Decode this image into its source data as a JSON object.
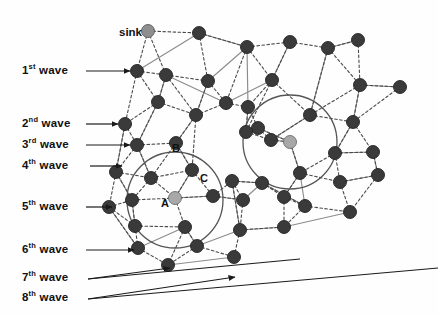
{
  "figure": {
    "type": "network-wave-diagram",
    "background_color": "#fefefe",
    "width": 438,
    "height": 315
  },
  "colors": {
    "node_dark": "#3a3a3a",
    "node_light": "#a8a8a8",
    "node_sink": "#8f8f8f",
    "edge_solid": "#8c8c8c",
    "edge_dashed": "#4a4a4a",
    "circle_stroke": "#555555",
    "arrow": "#1a1a1a",
    "text": "#111111"
  },
  "waves": [
    {
      "id": "wave-1",
      "ordinal": "1",
      "suffix": "st",
      "word": "wave",
      "label_x": 22,
      "label_y": 64,
      "arrow_x1": 86,
      "arrow_y1": 71,
      "arrow_x2": 130,
      "arrow_y2": 71
    },
    {
      "id": "wave-2",
      "ordinal": "2",
      "suffix": "nd",
      "word": "wave",
      "label_x": 22,
      "label_y": 117,
      "arrow_x1": 86,
      "arrow_y1": 124,
      "arrow_x2": 118,
      "arrow_y2": 124
    },
    {
      "id": "wave-3",
      "ordinal": "3",
      "suffix": "rd",
      "word": "wave",
      "label_x": 22,
      "label_y": 138,
      "arrow_x1": 86,
      "arrow_y1": 145,
      "arrow_x2": 130,
      "arrow_y2": 145
    },
    {
      "id": "wave-4",
      "ordinal": "4",
      "suffix": "th",
      "word": "wave",
      "label_x": 22,
      "label_y": 159,
      "arrow_x1": 90,
      "arrow_y1": 166,
      "arrow_x2": 122,
      "arrow_y2": 166
    },
    {
      "id": "wave-5",
      "ordinal": "5",
      "suffix": "th",
      "word": "wave",
      "label_x": 22,
      "label_y": 200,
      "arrow_x1": 86,
      "arrow_y1": 207,
      "arrow_x2": 112,
      "arrow_y2": 207
    },
    {
      "id": "wave-6",
      "ordinal": "6",
      "suffix": "th",
      "word": "wave",
      "label_x": 22,
      "label_y": 243,
      "arrow_x1": 86,
      "arrow_y1": 250,
      "arrow_x2": 134,
      "arrow_y2": 250
    },
    {
      "id": "wave-7",
      "ordinal": "7",
      "suffix": "th",
      "word": "wave",
      "label_x": 22,
      "label_y": 271,
      "arrow_x1": 88,
      "arrow_y1": 279,
      "arrow_x2": 170,
      "arrow_y2": 268
    },
    {
      "id": "wave-8",
      "ordinal": "8",
      "suffix": "th",
      "word": "wave",
      "label_x": 22,
      "label_y": 291,
      "arrow_x1": 88,
      "arrow_y1": 299,
      "arrow_x2": 235,
      "arrow_y2": 277
    }
  ],
  "annotations": [
    {
      "id": "sink-label",
      "text": "sink",
      "x": 119,
      "y": 26
    },
    {
      "id": "node-a-label",
      "text": "A",
      "x": 161,
      "y": 197
    },
    {
      "id": "node-b-label",
      "text": "B",
      "x": 172,
      "y": 142
    },
    {
      "id": "node-c-label",
      "text": "C",
      "x": 200,
      "y": 172
    }
  ],
  "circles": [
    {
      "id": "coverage-circle-left",
      "cx": 175,
      "cy": 200,
      "r": 48
    },
    {
      "id": "coverage-circle-right",
      "cx": 290,
      "cy": 142,
      "r": 47
    }
  ],
  "nodes": [
    {
      "id": "n-sink",
      "x": 148,
      "y": 31,
      "r": 6.5,
      "kind": "sink"
    },
    {
      "id": "n-01",
      "x": 199,
      "y": 33,
      "r": 6.5,
      "kind": "dark"
    },
    {
      "id": "n-02",
      "x": 247,
      "y": 47,
      "r": 6.5,
      "kind": "dark"
    },
    {
      "id": "n-03",
      "x": 290,
      "y": 42,
      "r": 6.5,
      "kind": "dark"
    },
    {
      "id": "n-04",
      "x": 328,
      "y": 48,
      "r": 6.5,
      "kind": "dark"
    },
    {
      "id": "n-05",
      "x": 358,
      "y": 40,
      "r": 6.5,
      "kind": "dark"
    },
    {
      "id": "n-06",
      "x": 137,
      "y": 71,
      "r": 6.5,
      "kind": "dark"
    },
    {
      "id": "n-07",
      "x": 166,
      "y": 75,
      "r": 6.5,
      "kind": "dark"
    },
    {
      "id": "n-08",
      "x": 208,
      "y": 81,
      "r": 6.5,
      "kind": "dark"
    },
    {
      "id": "n-09",
      "x": 272,
      "y": 80,
      "r": 6.5,
      "kind": "dark"
    },
    {
      "id": "n-10",
      "x": 360,
      "y": 85,
      "r": 6.5,
      "kind": "dark"
    },
    {
      "id": "n-11",
      "x": 400,
      "y": 87,
      "r": 6.5,
      "kind": "dark"
    },
    {
      "id": "n-12",
      "x": 158,
      "y": 102,
      "r": 6.5,
      "kind": "dark"
    },
    {
      "id": "n-13",
      "x": 226,
      "y": 103,
      "r": 6.5,
      "kind": "dark"
    },
    {
      "id": "n-14",
      "x": 248,
      "y": 107,
      "r": 6.5,
      "kind": "dark"
    },
    {
      "id": "n-15",
      "x": 125,
      "y": 124,
      "r": 6.5,
      "kind": "dark"
    },
    {
      "id": "n-16",
      "x": 196,
      "y": 115,
      "r": 6.5,
      "kind": "dark"
    },
    {
      "id": "n-17",
      "x": 258,
      "y": 128,
      "r": 6.5,
      "kind": "dark"
    },
    {
      "id": "n-18",
      "x": 310,
      "y": 115,
      "r": 6.5,
      "kind": "dark"
    },
    {
      "id": "n-19",
      "x": 353,
      "y": 122,
      "r": 6.5,
      "kind": "dark"
    },
    {
      "id": "n-20",
      "x": 137,
      "y": 145,
      "r": 6.5,
      "kind": "dark"
    },
    {
      "id": "n-21",
      "x": 176,
      "y": 143,
      "r": 6.5,
      "kind": "dark"
    },
    {
      "id": "n-22",
      "x": 246,
      "y": 132,
      "r": 6.5,
      "kind": "dark"
    },
    {
      "id": "n-23",
      "x": 271,
      "y": 140,
      "r": 6.5,
      "kind": "dark"
    },
    {
      "id": "n-24",
      "x": 290,
      "y": 142,
      "r": 6.5,
      "kind": "light"
    },
    {
      "id": "n-25",
      "x": 335,
      "y": 153,
      "r": 6.5,
      "kind": "dark"
    },
    {
      "id": "n-26",
      "x": 373,
      "y": 152,
      "r": 6.5,
      "kind": "dark"
    },
    {
      "id": "n-27",
      "x": 116,
      "y": 172,
      "r": 6.5,
      "kind": "dark"
    },
    {
      "id": "n-28",
      "x": 151,
      "y": 178,
      "r": 6.5,
      "kind": "dark"
    },
    {
      "id": "n-29",
      "x": 192,
      "y": 170,
      "r": 6.5,
      "kind": "dark"
    },
    {
      "id": "n-30",
      "x": 232,
      "y": 181,
      "r": 6.5,
      "kind": "dark"
    },
    {
      "id": "n-31",
      "x": 262,
      "y": 183,
      "r": 6.5,
      "kind": "dark"
    },
    {
      "id": "n-32",
      "x": 300,
      "y": 173,
      "r": 6.5,
      "kind": "dark"
    },
    {
      "id": "n-33",
      "x": 340,
      "y": 182,
      "r": 6.5,
      "kind": "dark"
    },
    {
      "id": "n-34",
      "x": 378,
      "y": 175,
      "r": 6.5,
      "kind": "dark"
    },
    {
      "id": "n-a",
      "x": 175,
      "y": 198,
      "r": 6.5,
      "kind": "light"
    },
    {
      "id": "n-35",
      "x": 109,
      "y": 207,
      "r": 6.5,
      "kind": "dark"
    },
    {
      "id": "n-36",
      "x": 132,
      "y": 200,
      "r": 6.5,
      "kind": "dark"
    },
    {
      "id": "n-37",
      "x": 213,
      "y": 196,
      "r": 6.5,
      "kind": "dark"
    },
    {
      "id": "n-38",
      "x": 243,
      "y": 200,
      "r": 6.5,
      "kind": "dark"
    },
    {
      "id": "n-39",
      "x": 284,
      "y": 197,
      "r": 6.5,
      "kind": "dark"
    },
    {
      "id": "n-40",
      "x": 305,
      "y": 206,
      "r": 6.5,
      "kind": "dark"
    },
    {
      "id": "n-41",
      "x": 350,
      "y": 212,
      "r": 6.5,
      "kind": "dark"
    },
    {
      "id": "n-42",
      "x": 135,
      "y": 226,
      "r": 6.5,
      "kind": "dark"
    },
    {
      "id": "n-43",
      "x": 185,
      "y": 227,
      "r": 6.5,
      "kind": "dark"
    },
    {
      "id": "n-44",
      "x": 240,
      "y": 230,
      "r": 6.5,
      "kind": "dark"
    },
    {
      "id": "n-45",
      "x": 284,
      "y": 227,
      "r": 6.5,
      "kind": "dark"
    },
    {
      "id": "n-46",
      "x": 138,
      "y": 248,
      "r": 6.5,
      "kind": "dark"
    },
    {
      "id": "n-47",
      "x": 197,
      "y": 246,
      "r": 6.5,
      "kind": "dark"
    },
    {
      "id": "n-48",
      "x": 168,
      "y": 265,
      "r": 6.5,
      "kind": "dark"
    },
    {
      "id": "n-49",
      "x": 234,
      "y": 257,
      "r": 6.5,
      "kind": "dark"
    }
  ],
  "solid_edges": [
    [
      "n-06",
      "n-01"
    ],
    [
      "n-01",
      "n-02"
    ],
    [
      "n-07",
      "n-13"
    ],
    [
      "n-13",
      "n-09"
    ],
    [
      "n-09",
      "n-03"
    ],
    [
      "n-02",
      "n-14"
    ],
    [
      "n-14",
      "n-22"
    ],
    [
      "n-22",
      "n-17"
    ],
    [
      "n-17",
      "n-24"
    ],
    [
      "n-24",
      "n-23"
    ],
    [
      "n-23",
      "n-18"
    ],
    [
      "n-18",
      "n-04"
    ],
    [
      "n-04",
      "n-05"
    ],
    [
      "n-10",
      "n-11"
    ],
    [
      "n-19",
      "n-10"
    ],
    [
      "n-25",
      "n-19"
    ],
    [
      "n-26",
      "n-25"
    ],
    [
      "n-34",
      "n-26"
    ],
    [
      "n-33",
      "n-34"
    ],
    [
      "n-12",
      "n-20"
    ],
    [
      "n-20",
      "n-28"
    ],
    [
      "n-15",
      "n-27"
    ],
    [
      "n-16",
      "n-21"
    ],
    [
      "n-21",
      "n-29"
    ],
    [
      "n-29",
      "n-a"
    ],
    [
      "n-a",
      "n-37"
    ],
    [
      "n-37",
      "n-38"
    ],
    [
      "n-38",
      "n-31"
    ],
    [
      "n-31",
      "n-40"
    ],
    [
      "n-40",
      "n-32"
    ],
    [
      "n-32",
      "n-39"
    ],
    [
      "n-27",
      "n-36"
    ],
    [
      "n-36",
      "n-42"
    ],
    [
      "n-35",
      "n-46"
    ],
    [
      "n-46",
      "n-43"
    ],
    [
      "n-43",
      "n-47"
    ],
    [
      "n-47",
      "n-44"
    ],
    [
      "n-44",
      "n-45"
    ],
    [
      "n-45",
      "n-41"
    ],
    [
      "n-48",
      "n-49"
    ],
    [
      "n-24",
      "n-32"
    ],
    [
      "n-16",
      "n-08"
    ],
    [
      "n-08",
      "n-02"
    ],
    [
      "n-12",
      "n-07"
    ],
    [
      "n-30",
      "n-44"
    ],
    [
      "n-31",
      "n-30"
    ]
  ],
  "dashed_edges": [
    [
      "n-sink",
      "n-01"
    ],
    [
      "n-sink",
      "n-06"
    ],
    [
      "n-sink",
      "n-07"
    ],
    [
      "n-01",
      "n-08"
    ],
    [
      "n-01",
      "n-02"
    ],
    [
      "n-02",
      "n-03"
    ],
    [
      "n-02",
      "n-09"
    ],
    [
      "n-02",
      "n-13"
    ],
    [
      "n-03",
      "n-04"
    ],
    [
      "n-03",
      "n-09"
    ],
    [
      "n-04",
      "n-05"
    ],
    [
      "n-04",
      "n-10"
    ],
    [
      "n-04",
      "n-18"
    ],
    [
      "n-05",
      "n-10"
    ],
    [
      "n-06",
      "n-07"
    ],
    [
      "n-06",
      "n-12"
    ],
    [
      "n-06",
      "n-15"
    ],
    [
      "n-07",
      "n-08"
    ],
    [
      "n-07",
      "n-12"
    ],
    [
      "n-07",
      "n-16"
    ],
    [
      "n-08",
      "n-13"
    ],
    [
      "n-08",
      "n-16"
    ],
    [
      "n-09",
      "n-14"
    ],
    [
      "n-09",
      "n-18"
    ],
    [
      "n-09",
      "n-22"
    ],
    [
      "n-10",
      "n-11"
    ],
    [
      "n-10",
      "n-19"
    ],
    [
      "n-10",
      "n-18"
    ],
    [
      "n-11",
      "n-19"
    ],
    [
      "n-12",
      "n-15"
    ],
    [
      "n-12",
      "n-16"
    ],
    [
      "n-12",
      "n-20"
    ],
    [
      "n-13",
      "n-14"
    ],
    [
      "n-13",
      "n-16"
    ],
    [
      "n-14",
      "n-17"
    ],
    [
      "n-14",
      "n-22"
    ],
    [
      "n-15",
      "n-20"
    ],
    [
      "n-15",
      "n-27"
    ],
    [
      "n-16",
      "n-21"
    ],
    [
      "n-16",
      "n-29"
    ],
    [
      "n-17",
      "n-22"
    ],
    [
      "n-17",
      "n-23"
    ],
    [
      "n-17",
      "n-24"
    ],
    [
      "n-18",
      "n-19"
    ],
    [
      "n-18",
      "n-23"
    ],
    [
      "n-19",
      "n-25"
    ],
    [
      "n-19",
      "n-26"
    ],
    [
      "n-20",
      "n-21"
    ],
    [
      "n-20",
      "n-27"
    ],
    [
      "n-20",
      "n-28"
    ],
    [
      "n-21",
      "n-29"
    ],
    [
      "n-21",
      "n-28"
    ],
    [
      "n-22",
      "n-23"
    ],
    [
      "n-23",
      "n-24"
    ],
    [
      "n-24",
      "n-32"
    ],
    [
      "n-25",
      "n-26"
    ],
    [
      "n-25",
      "n-32"
    ],
    [
      "n-25",
      "n-33"
    ],
    [
      "n-26",
      "n-34"
    ],
    [
      "n-27",
      "n-28"
    ],
    [
      "n-27",
      "n-36"
    ],
    [
      "n-27",
      "n-35"
    ],
    [
      "n-28",
      "n-29"
    ],
    [
      "n-28",
      "n-36"
    ],
    [
      "n-28",
      "n-a"
    ],
    [
      "n-29",
      "n-a"
    ],
    [
      "n-29",
      "n-37"
    ],
    [
      "n-30",
      "n-31"
    ],
    [
      "n-30",
      "n-38"
    ],
    [
      "n-30",
      "n-44"
    ],
    [
      "n-31",
      "n-39"
    ],
    [
      "n-31",
      "n-40"
    ],
    [
      "n-32",
      "n-39"
    ],
    [
      "n-32",
      "n-33"
    ],
    [
      "n-33",
      "n-34"
    ],
    [
      "n-33",
      "n-41"
    ],
    [
      "n-34",
      "n-41"
    ],
    [
      "n-a",
      "n-37"
    ],
    [
      "n-a",
      "n-43"
    ],
    [
      "n-a",
      "n-36"
    ],
    [
      "n-35",
      "n-36"
    ],
    [
      "n-35",
      "n-42"
    ],
    [
      "n-35",
      "n-46"
    ],
    [
      "n-36",
      "n-42"
    ],
    [
      "n-37",
      "n-38"
    ],
    [
      "n-37",
      "n-30"
    ],
    [
      "n-38",
      "n-44"
    ],
    [
      "n-39",
      "n-40"
    ],
    [
      "n-39",
      "n-45"
    ],
    [
      "n-40",
      "n-45"
    ],
    [
      "n-40",
      "n-41"
    ],
    [
      "n-42",
      "n-43"
    ],
    [
      "n-42",
      "n-46"
    ],
    [
      "n-43",
      "n-47"
    ],
    [
      "n-43",
      "n-48"
    ],
    [
      "n-44",
      "n-45"
    ],
    [
      "n-44",
      "n-49"
    ],
    [
      "n-46",
      "n-48"
    ],
    [
      "n-47",
      "n-49"
    ],
    [
      "n-47",
      "n-48"
    ]
  ]
}
